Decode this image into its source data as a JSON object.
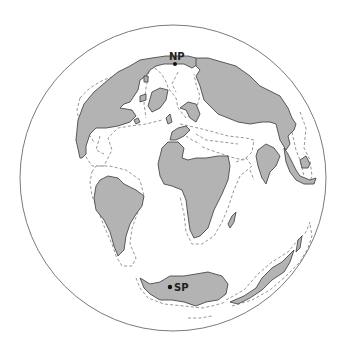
{
  "map": {
    "projection": "orthographic-globe",
    "colors": {
      "land": "#b3b3b3",
      "land_outline": "#4a4a4a",
      "shelf_outline": "#8a8a8a",
      "ocean": "#ffffff",
      "globe_outline": "#7a7a7a",
      "pole_marker": "#111111"
    },
    "labels": {
      "north_pole": "NP",
      "south_pole": "SP"
    },
    "landmasses": [
      "north-america",
      "greenland",
      "eurasia",
      "arctic-islands",
      "south-america",
      "africa",
      "madagascar",
      "india",
      "southeast-asia",
      "antarctica",
      "australia"
    ]
  }
}
